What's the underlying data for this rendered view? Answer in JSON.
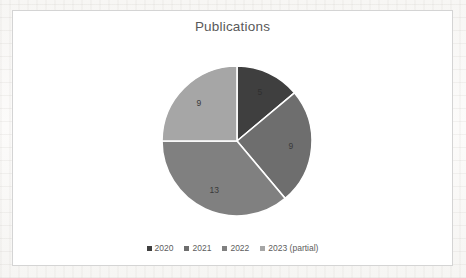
{
  "frame": {
    "border_color": "#d4d4d4",
    "background": "#ffffff"
  },
  "chart_data": {
    "type": "pie",
    "title": "Publications",
    "categories": [
      "2020",
      "2021",
      "2022",
      "2023 (partial)"
    ],
    "values": [
      5,
      9,
      13,
      9
    ],
    "labels": [
      "5",
      "9",
      "13",
      "9"
    ],
    "colors": [
      "#3f3f3f",
      "#6e6e6e",
      "#808080",
      "#a6a6a6"
    ],
    "total": 36,
    "start_angle_deg": 0,
    "direction": "clockwise",
    "legend_position": "bottom",
    "grid": false,
    "xlabel": "",
    "ylabel": ""
  },
  "legend": {
    "items": [
      {
        "label": "2020",
        "color": "#3f3f3f"
      },
      {
        "label": "2021",
        "color": "#6e6e6e"
      },
      {
        "label": "2022",
        "color": "#808080"
      },
      {
        "label": "2023 (partial)",
        "color": "#a6a6a6"
      }
    ]
  }
}
